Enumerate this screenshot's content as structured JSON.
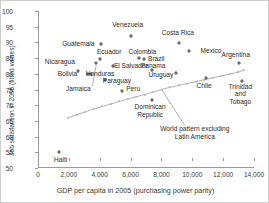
{
  "chart_data": {
    "type": "scatter",
    "title": "",
    "xlabel": "GDP per capita in 2005 (purchasing power parity)",
    "ylabel": "Job satisfaction in 2006 (fitted values)",
    "xlim": [
      0,
      14000
    ],
    "ylim": [
      50,
      100
    ],
    "xticks": [
      "0",
      "2,000",
      "4,000",
      "6,000",
      "8,000",
      "10,000",
      "12,000",
      "14,000"
    ],
    "xtick_values": [
      0,
      2000,
      4000,
      6000,
      8000,
      10000,
      12000,
      14000
    ],
    "yticks": [
      "50",
      "55",
      "60",
      "65",
      "70",
      "75",
      "80",
      "85",
      "90",
      "95",
      "100"
    ],
    "ytick_values": [
      50,
      55,
      60,
      65,
      70,
      75,
      80,
      85,
      90,
      95,
      100
    ],
    "grid": false,
    "legend": "none",
    "points": [
      {
        "name": "Haiti",
        "x": 1300,
        "y": 55.0,
        "lx": 1400,
        "ly": 52.4
      },
      {
        "name": "Guatemala",
        "x": 4000,
        "y": 89.4,
        "lx": 2550,
        "ly": 89.4
      },
      {
        "name": "Venezuela",
        "x": 5950,
        "y": 92.0,
        "lx": 5750,
        "ly": 95.6
      },
      {
        "name": "Costa Rica",
        "x": 9050,
        "y": 89.7,
        "lx": 9000,
        "ly": 93.0
      },
      {
        "name": "Mexico",
        "x": 9700,
        "y": 87.4,
        "lx": 11150,
        "ly": 87.4
      },
      {
        "name": "Nicaragua",
        "x": 2500,
        "y": 81.0,
        "lx": 1350,
        "ly": 83.7
      },
      {
        "name": "Ecuador",
        "x": 3950,
        "y": 84.6,
        "lx": 4550,
        "ly": 87.1
      },
      {
        "name": "Colombia",
        "x": 6500,
        "y": 84.9,
        "lx": 6700,
        "ly": 87.1
      },
      {
        "name": "Brazil",
        "x": 6800,
        "y": 84.7,
        "lx": 7600,
        "ly": 84.6
      },
      {
        "name": "Argentina",
        "x": 12950,
        "y": 83.3,
        "lx": 12750,
        "ly": 86.0
      },
      {
        "name": "El Salvador",
        "x": 4800,
        "y": 82.5,
        "lx": 5950,
        "ly": 82.5
      },
      {
        "name": "Bolivia",
        "x": 3150,
        "y": 79.9,
        "lx": 1850,
        "ly": 79.9
      },
      {
        "name": "Honduras",
        "x": 3400,
        "y": 80.0,
        "lx": 3950,
        "ly": 79.9
      },
      {
        "name": "Panama",
        "x": 7350,
        "y": 81.2,
        "lx": 7400,
        "ly": 82.4
      },
      {
        "name": "Uruguay",
        "x": 8900,
        "y": 80.3,
        "lx": 7900,
        "ly": 79.7
      },
      {
        "name": "Paraguay",
        "x": 4300,
        "y": 77.9,
        "lx": 5050,
        "ly": 77.6
      },
      {
        "name": "Peru",
        "x": 5350,
        "y": 74.6,
        "lx": 6100,
        "ly": 75.2
      },
      {
        "name": "Chile",
        "x": 10800,
        "y": 78.6,
        "lx": 10700,
        "ly": 76.2
      },
      {
        "name": "Trinidad and Tobago",
        "x": 13150,
        "y": 77.7,
        "lx": 13050,
        "ly": 73.6
      },
      {
        "name": "Jamaica",
        "x": 3700,
        "y": 83.3,
        "lx": 2550,
        "ly": 75.2
      },
      {
        "name": "Dominican Republic",
        "x": 7350,
        "y": 71.8,
        "lx": 7200,
        "ly": 68.4
      }
    ],
    "multiline_labels": {
      "Trinidad and Tobago": [
        "Trinidad",
        "and",
        "Tobago"
      ],
      "Dominican Republic": [
        "Dominican",
        "Republic"
      ]
    },
    "trend_line": {
      "label": "World pattern excluding Latin America",
      "label_lines": [
        "World pattern excluding",
        "Latin America"
      ],
      "label_x": 10100,
      "label_y": 61.0,
      "pointer_from_x": 9450,
      "pointer_from_y": 63.5,
      "pointer_to_x": 7950,
      "pointer_to_y": 75.0,
      "x": [
        1900,
        2450,
        3000,
        3550,
        4100,
        4650,
        5200,
        5750,
        6300,
        6850,
        7400,
        7950,
        8500,
        9050,
        9600,
        10150,
        10700,
        11250,
        11800,
        12350,
        12900,
        13300
      ],
      "y": [
        66.0,
        67.0,
        67.9,
        68.8,
        69.6,
        70.4,
        71.2,
        72.0,
        72.7,
        73.4,
        74.2,
        75.0,
        75.7,
        76.3,
        76.9,
        77.5,
        78.1,
        78.7,
        79.3,
        79.9,
        80.5,
        81.3
      ]
    },
    "colors": {
      "marker": "#6e6e6e",
      "trend": "#b9b9b9",
      "axis": "#9a9a9a",
      "text": "#2b2b2b",
      "background": "#ffffff"
    }
  }
}
